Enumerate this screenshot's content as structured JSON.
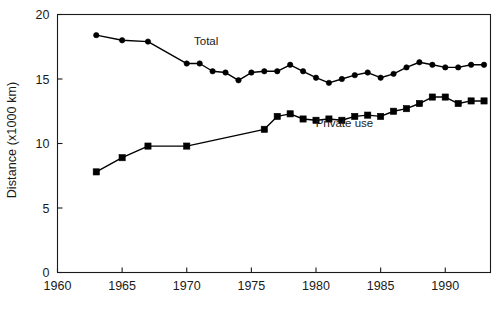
{
  "chart_data": {
    "type": "line",
    "title": "",
    "xlabel": "",
    "ylabel": "Distance (x1000 km)",
    "xlim": [
      1960,
      1993.5
    ],
    "ylim": [
      0,
      20
    ],
    "xticks": [
      1960,
      1965,
      1970,
      1975,
      1980,
      1985,
      1990
    ],
    "xtick_labels": [
      "1960",
      "1965",
      "1970",
      "1975",
      "1980",
      "1985",
      "1990"
    ],
    "yticks": [
      0,
      5,
      10,
      15,
      20
    ],
    "ytick_labels": [
      "0",
      "5",
      "10",
      "15",
      "20"
    ],
    "grid": false,
    "legend_position": "inline-annotation",
    "series": [
      {
        "name": "Total",
        "marker": "circle",
        "color": "#000000",
        "label_x": 1971.5,
        "label_y": 17.6,
        "points": [
          {
            "x": 1963,
            "y": 18.4
          },
          {
            "x": 1965,
            "y": 18.0
          },
          {
            "x": 1967,
            "y": 17.9
          },
          {
            "x": 1970,
            "y": 16.2
          },
          {
            "x": 1971,
            "y": 16.2
          },
          {
            "x": 1972,
            "y": 15.6
          },
          {
            "x": 1973,
            "y": 15.5
          },
          {
            "x": 1974,
            "y": 14.9
          },
          {
            "x": 1975,
            "y": 15.5
          },
          {
            "x": 1976,
            "y": 15.6
          },
          {
            "x": 1977,
            "y": 15.6
          },
          {
            "x": 1978,
            "y": 16.1
          },
          {
            "x": 1979,
            "y": 15.6
          },
          {
            "x": 1980,
            "y": 15.1
          },
          {
            "x": 1981,
            "y": 14.7
          },
          {
            "x": 1982,
            "y": 15.0
          },
          {
            "x": 1983,
            "y": 15.3
          },
          {
            "x": 1984,
            "y": 15.5
          },
          {
            "x": 1985,
            "y": 15.1
          },
          {
            "x": 1986,
            "y": 15.4
          },
          {
            "x": 1987,
            "y": 15.9
          },
          {
            "x": 1988,
            "y": 16.3
          },
          {
            "x": 1989,
            "y": 16.1
          },
          {
            "x": 1990,
            "y": 15.9
          },
          {
            "x": 1991,
            "y": 15.9
          },
          {
            "x": 1992,
            "y": 16.1
          },
          {
            "x": 1993,
            "y": 16.1
          }
        ]
      },
      {
        "name": "Private use",
        "marker": "square",
        "color": "#000000",
        "label_x": 1982.2,
        "label_y": 11.3,
        "points": [
          {
            "x": 1963,
            "y": 7.8
          },
          {
            "x": 1965,
            "y": 8.9
          },
          {
            "x": 1967,
            "y": 9.8
          },
          {
            "x": 1970,
            "y": 9.8
          },
          {
            "x": 1976,
            "y": 11.1
          },
          {
            "x": 1977,
            "y": 12.1
          },
          {
            "x": 1978,
            "y": 12.3
          },
          {
            "x": 1979,
            "y": 11.9
          },
          {
            "x": 1980,
            "y": 11.8
          },
          {
            "x": 1981,
            "y": 11.9
          },
          {
            "x": 1982,
            "y": 11.8
          },
          {
            "x": 1983,
            "y": 12.1
          },
          {
            "x": 1984,
            "y": 12.2
          },
          {
            "x": 1985,
            "y": 12.1
          },
          {
            "x": 1986,
            "y": 12.5
          },
          {
            "x": 1987,
            "y": 12.7
          },
          {
            "x": 1988,
            "y": 13.1
          },
          {
            "x": 1989,
            "y": 13.6
          },
          {
            "x": 1990,
            "y": 13.6
          },
          {
            "x": 1991,
            "y": 13.1
          },
          {
            "x": 1992,
            "y": 13.3
          },
          {
            "x": 1993,
            "y": 13.3
          }
        ]
      }
    ]
  }
}
